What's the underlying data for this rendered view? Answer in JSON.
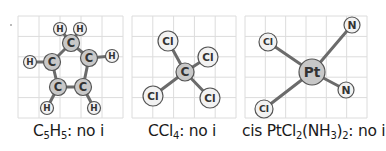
{
  "figure": {
    "type": "molecule-diagrams",
    "panels": [
      {
        "id": "c5h5",
        "caption": {
          "pre": "C",
          "sub1": "5",
          "mid": "H",
          "sub2": "5",
          "post": ": no i"
        },
        "caption_text": "C5H5: no i",
        "grid": {
          "x": 18,
          "y": 16,
          "w": 105,
          "h": 102,
          "cols": 5,
          "rows": 5
        },
        "atoms": [
          {
            "label": "C",
            "x": 71,
            "y": 43,
            "r": 8.5,
            "fill": "#c8c8c8"
          },
          {
            "label": "C",
            "x": 52,
            "y": 62,
            "r": 8.5,
            "fill": "#c8c8c8"
          },
          {
            "label": "C",
            "x": 89,
            "y": 58,
            "r": 8.5,
            "fill": "#c8c8c8"
          },
          {
            "label": "C",
            "x": 58,
            "y": 87,
            "r": 8.5,
            "fill": "#c8c8c8"
          },
          {
            "label": "C",
            "x": 83,
            "y": 87,
            "r": 8.5,
            "fill": "#c8c8c8"
          },
          {
            "label": "H",
            "x": 60,
            "y": 29,
            "r": 6.5,
            "fill": "#f2f2f2"
          },
          {
            "label": "H",
            "x": 80,
            "y": 29,
            "r": 6.5,
            "fill": "#f2f2f2"
          },
          {
            "label": "H",
            "x": 30,
            "y": 62,
            "r": 6.5,
            "fill": "#f2f2f2"
          },
          {
            "label": "H",
            "x": 112,
            "y": 56,
            "r": 6.5,
            "fill": "#f2f2f2"
          },
          {
            "label": "H",
            "x": 47,
            "y": 108,
            "r": 6.5,
            "fill": "#f2f2f2"
          },
          {
            "label": "H",
            "x": 94,
            "y": 108,
            "r": 6.5,
            "fill": "#f2f2f2"
          }
        ],
        "bonds": [
          [
            0,
            1
          ],
          [
            0,
            2
          ],
          [
            1,
            3
          ],
          [
            2,
            4
          ],
          [
            3,
            4
          ],
          [
            0,
            5
          ],
          [
            0,
            6
          ],
          [
            1,
            7
          ],
          [
            2,
            8
          ],
          [
            3,
            9
          ],
          [
            4,
            10
          ]
        ]
      },
      {
        "id": "ccl4",
        "caption": {
          "pre": "CCl",
          "sub1": "4",
          "mid": "",
          "sub2": "",
          "post": ": no i"
        },
        "caption_text": "CCl4: no i",
        "grid": {
          "x": 132,
          "y": 16,
          "w": 104,
          "h": 102,
          "cols": 5,
          "rows": 5
        },
        "atoms": [
          {
            "label": "C",
            "x": 185,
            "y": 72,
            "r": 9,
            "fill": "#c8c8c8"
          },
          {
            "label": "Cl",
            "x": 168,
            "y": 41,
            "r": 10,
            "fill": "#f2f2f2"
          },
          {
            "label": "Cl",
            "x": 208,
            "y": 57,
            "r": 10,
            "fill": "#f2f2f2"
          },
          {
            "label": "Cl",
            "x": 153,
            "y": 96,
            "r": 10,
            "fill": "#f2f2f2"
          },
          {
            "label": "Cl",
            "x": 210,
            "y": 98,
            "r": 10,
            "fill": "#f2f2f2"
          }
        ],
        "bonds": [
          [
            0,
            1
          ],
          [
            0,
            2
          ],
          [
            0,
            3
          ],
          [
            0,
            4
          ]
        ]
      },
      {
        "id": "cis-ptcl2nh3",
        "caption": {
          "pre": "cis PtCl",
          "sub1": "2",
          "mid": "(NH",
          "sub2": "3",
          "post": ")",
          "sub3": "2",
          "tail": ": no i"
        },
        "caption_text": "cis PtCl2(NH3)2: no i",
        "grid": {
          "x": 245,
          "y": 16,
          "w": 122,
          "h": 102,
          "cols": 6,
          "rows": 5
        },
        "atoms": [
          {
            "label": "Pt",
            "x": 312,
            "y": 72,
            "r": 13,
            "fill": "#c8c8c8"
          },
          {
            "label": "Cl",
            "x": 268,
            "y": 42,
            "r": 9,
            "fill": "#f2f2f2"
          },
          {
            "label": "Cl",
            "x": 264,
            "y": 109,
            "r": 9,
            "fill": "#f2f2f2"
          },
          {
            "label": "N",
            "x": 352,
            "y": 25,
            "r": 8,
            "fill": "#f2f2f2"
          },
          {
            "label": "N",
            "x": 346,
            "y": 90,
            "r": 8,
            "fill": "#f2f2f2"
          }
        ],
        "bonds": [
          [
            0,
            1
          ],
          [
            0,
            2
          ],
          [
            0,
            3
          ],
          [
            0,
            4
          ]
        ]
      }
    ],
    "colors": {
      "grid": "#dcdcdc",
      "bond": "#6b6b6b",
      "stroke": "#555555",
      "text": "#1a1a1a"
    }
  }
}
